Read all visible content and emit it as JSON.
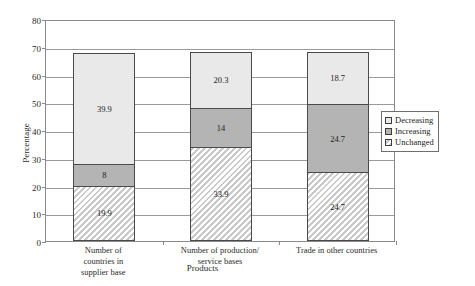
{
  "chart_data": {
    "type": "bar",
    "subtype": "stacked-bar",
    "title": "",
    "xlabel": "Products",
    "ylabel": "Percentage",
    "ylim": [
      0,
      80
    ],
    "yticks": [
      0,
      10,
      20,
      30,
      40,
      50,
      60,
      70,
      80
    ],
    "grid": true,
    "legend_position": "right",
    "categories": [
      "Number of countries in supplier base",
      "Number of production/ service bases",
      "Trade in other countries"
    ],
    "category_lines": [
      [
        "Number of",
        "countries in",
        "supplier base"
      ],
      [
        "Number of production/",
        "service bases"
      ],
      [
        "Trade in other countries"
      ]
    ],
    "series": [
      {
        "name": "Unchanged",
        "fill": "hatched",
        "color": "#c9c9c9",
        "values": [
          19.9,
          33.9,
          24.7
        ],
        "labels": [
          "19.9",
          "33.9",
          "24.7"
        ]
      },
      {
        "name": "Increasing",
        "fill": "solid-gray",
        "color": "#b4b4b4",
        "values": [
          8,
          14,
          24.7
        ],
        "labels": [
          "8",
          "14",
          "24.7"
        ]
      },
      {
        "name": "Decreasing",
        "fill": "light",
        "color": "#e9e9e9",
        "values": [
          39.9,
          20.3,
          18.7
        ],
        "labels": [
          "39.9",
          "20.3",
          "18.7"
        ]
      }
    ],
    "totals": [
      67.8,
      68.2,
      68.1
    ]
  },
  "legend": {
    "items": [
      {
        "label": "Decreasing",
        "swatch": "light"
      },
      {
        "label": "Increasing",
        "swatch": "solid-gray"
      },
      {
        "label": "Unchanged",
        "swatch": "hatched"
      }
    ]
  },
  "axis": {
    "y_title": "Percentage",
    "x_title": "Products",
    "y_tick_labels": [
      "0",
      "10",
      "20",
      "30",
      "40",
      "50",
      "60",
      "70",
      "80"
    ]
  }
}
